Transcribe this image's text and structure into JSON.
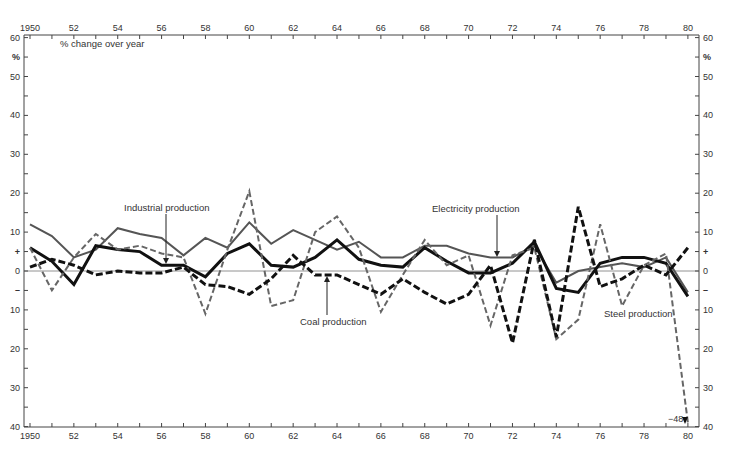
{
  "chart_data": {
    "type": "line",
    "title": "",
    "subtitle": "% change over year",
    "xlabel": "",
    "ylabel": "%",
    "x": [
      1950,
      1951,
      1952,
      1953,
      1954,
      1955,
      1956,
      1957,
      1958,
      1959,
      1960,
      1961,
      1962,
      1963,
      1964,
      1965,
      1966,
      1967,
      1968,
      1969,
      1970,
      1971,
      1972,
      1973,
      1974,
      1975,
      1976,
      1977,
      1978,
      1979,
      1980
    ],
    "xlim": [
      1950,
      1980
    ],
    "ylim": [
      -40,
      60
    ],
    "grid": false,
    "legend_position": "inline annotations",
    "x_tick_labels": [
      "1950",
      "52",
      "54",
      "56",
      "58",
      "60",
      "62",
      "64",
      "66",
      "68",
      "70",
      "72",
      "74",
      "76",
      "78",
      "80"
    ],
    "y_tick_labels": [
      "60",
      "%",
      "50",
      "40",
      "30",
      "20",
      "10",
      "+",
      "0",
      "–",
      "10",
      "20",
      "30",
      "40"
    ],
    "series": [
      {
        "name": "Electricity production",
        "style": "thin-solid",
        "color": "#555555",
        "values": [
          12,
          9,
          3.5,
          5.5,
          11,
          9.5,
          8.5,
          4,
          8.5,
          6,
          12.5,
          7,
          10.5,
          8,
          5.5,
          7.5,
          3.5,
          3.5,
          6.5,
          6.5,
          4.5,
          3.5,
          3.5,
          6.5,
          -3,
          0,
          1,
          2,
          1,
          3.5,
          -5.5
        ]
      },
      {
        "name": "Industrial production",
        "style": "thick-solid",
        "color": "#111111",
        "values": [
          6,
          2.5,
          -3.5,
          6.5,
          5.5,
          5,
          1.5,
          1.5,
          -1.5,
          4.5,
          7,
          1.5,
          1,
          3.5,
          8,
          3,
          1.5,
          1,
          6,
          2.5,
          -0.5,
          -0.5,
          2,
          7.5,
          -4.5,
          -5.5,
          2,
          3.5,
          3.5,
          2,
          -6.5
        ]
      },
      {
        "name": "Steel production",
        "style": "thin-dashed",
        "color": "#666666",
        "values": [
          6,
          -5,
          3.5,
          9.5,
          5.5,
          6.5,
          4.5,
          3.5,
          -11,
          5.5,
          20.5,
          -9,
          -7.5,
          10,
          14,
          6,
          -10.5,
          -1,
          8,
          1.5,
          4,
          -14,
          4,
          6,
          -17.5,
          -12.5,
          12,
          -9,
          1.5,
          4.5,
          -48
        ]
      },
      {
        "name": "Coal production",
        "style": "thick-dashed",
        "color": "#111111",
        "values": [
          1,
          3,
          1.5,
          -1,
          0,
          -0.5,
          -0.5,
          1,
          -3.5,
          -4,
          -6,
          -2,
          4,
          -1,
          -1,
          -3.5,
          -6,
          -2,
          -5.5,
          -8.5,
          -6,
          1.5,
          -18.5,
          8,
          -17,
          16.5,
          -4,
          -2,
          1.5,
          -1,
          6
        ]
      }
    ],
    "annotations": [
      {
        "text": "% change over year"
      },
      {
        "text": "Industrial production"
      },
      {
        "text": "Electricity production"
      },
      {
        "text": "Coal production"
      },
      {
        "text": "Steel production"
      },
      {
        "text": "-48"
      }
    ]
  },
  "labels": {
    "subtitle": "% change over year",
    "industrial": "Industrial production",
    "electricity": "Electricity production",
    "coal": "Coal production",
    "steel": "Steel production",
    "steel_1980_offscale": "−48",
    "unit_left": "%",
    "unit_right": "%"
  }
}
